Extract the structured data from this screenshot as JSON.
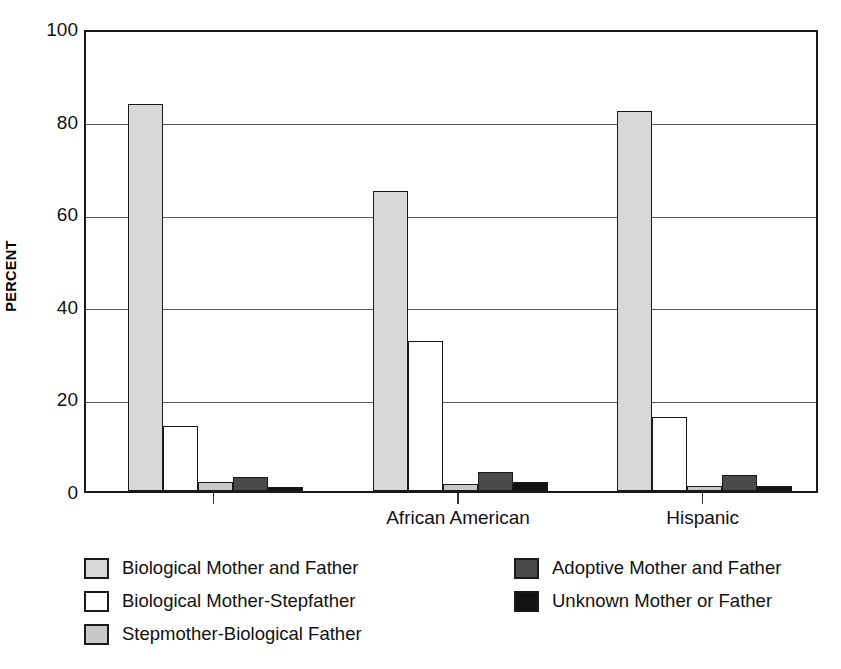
{
  "chart_data": {
    "type": "bar",
    "title": "",
    "xlabel": "",
    "ylabel": "PERCENT",
    "ylim": [
      0,
      100
    ],
    "yticks": [
      0,
      20,
      40,
      60,
      80,
      100
    ],
    "ytick_labels": [
      "0",
      "20",
      "40",
      "60",
      "80",
      "100"
    ],
    "grid": true,
    "grid_axis": "y",
    "legend_position": "below-plot",
    "categories": [
      "",
      "African American",
      "Hispanic"
    ],
    "series": [
      {
        "name": "Biological Mother and Father",
        "color": "#d8d8d8",
        "values": [
          83.5,
          64.8,
          82.0
        ]
      },
      {
        "name": "Biological Mother-Stepfather",
        "color": "#ffffff",
        "values": [
          14.0,
          32.5,
          16.0
        ]
      },
      {
        "name": "Stepmother-Biological Father",
        "color": "#c8c8c8",
        "values": [
          2.0,
          1.5,
          1.0
        ]
      },
      {
        "name": "Adoptive Mother and Father",
        "color": "#4a4a4a",
        "values": [
          3.0,
          4.0,
          3.5
        ]
      },
      {
        "name": "Unknown Mother or Father",
        "color": "#121212",
        "values": [
          0.8,
          2.0,
          1.0
        ]
      }
    ]
  },
  "axis": {
    "ylabel": "PERCENT",
    "ytick_labels": [
      "100",
      "80",
      "60",
      "40",
      "20",
      "0"
    ],
    "xtick_labels": [
      "",
      "African American",
      "Hispanic"
    ]
  },
  "legend": {
    "left_column": [
      {
        "label": "Biological Mother and Father",
        "color": "#d8d8d8"
      },
      {
        "label": "Biological Mother-Stepfather",
        "color": "#ffffff"
      },
      {
        "label": "Stepmother-Biological Father",
        "color": "#c8c8c8"
      }
    ],
    "right_column": [
      {
        "label": "Adoptive Mother and Father",
        "color": "#4a4a4a"
      },
      {
        "label": "Unknown Mother or Father",
        "color": "#121212"
      }
    ]
  },
  "colors": {
    "frame": "#1a1a1a",
    "gridline": "#5a5a5a",
    "background": "#ffffff",
    "text": "#111111"
  }
}
